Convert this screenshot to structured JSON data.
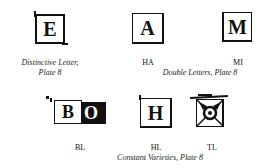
{
  "top_row": {
    "distinctive": {
      "letter": "E",
      "caption_line1": "Distinctive Letter,",
      "caption_line2": "Plate 8"
    },
    "double_letters": {
      "items": [
        {
          "letter": "A",
          "label": "HA"
        },
        {
          "letter": "M",
          "label": "MI"
        }
      ],
      "caption": "Double Letters, Plate 8"
    }
  },
  "bottom_row": {
    "constant_varieties": {
      "items": [
        {
          "letters": [
            "B",
            "O"
          ],
          "label": "BL"
        },
        {
          "letter": "H",
          "label": "HL"
        },
        {
          "letter": "✲",
          "label": "TL"
        }
      ],
      "caption": "Constant Varieties, Plate 8"
    }
  }
}
